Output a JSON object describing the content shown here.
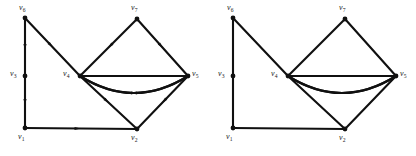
{
  "figure": {
    "title": "",
    "background_color": "#ffffff",
    "stroke_color": "#101010",
    "width": 416,
    "height": 156,
    "panel_count": 2
  },
  "panels": [
    {
      "id": "left-panel",
      "name": "directed-multigraph",
      "directed": true,
      "origin_x": 0,
      "vertices": [
        {
          "id": "v6",
          "label": "v",
          "sub": "6",
          "x": 25,
          "y": 18,
          "label_x": 19,
          "label_y": 4,
          "dot": true
        },
        {
          "id": "v3",
          "label": "v",
          "sub": "3",
          "x": 25,
          "y": 76,
          "label_x": 10,
          "label_y": 70,
          "dot": true
        },
        {
          "id": "v1",
          "label": "v",
          "sub": "1",
          "x": 25,
          "y": 128,
          "label_x": 18,
          "label_y": 133,
          "dot": true
        },
        {
          "id": "v4",
          "label": "v",
          "sub": "4",
          "x": 80,
          "y": 76,
          "label_x": 63,
          "label_y": 70,
          "dot": true
        },
        {
          "id": "v7",
          "label": "v",
          "sub": "7",
          "x": 137,
          "y": 19,
          "label_x": 131,
          "label_y": 4,
          "dot": true
        },
        {
          "id": "v2",
          "label": "v",
          "sub": "2",
          "x": 137,
          "y": 129,
          "label_x": 131,
          "label_y": 134,
          "dot": true
        },
        {
          "id": "v5",
          "label": "v",
          "sub": "5",
          "x": 188,
          "y": 76,
          "label_x": 192,
          "label_y": 70,
          "dot": true
        }
      ],
      "edges": [
        {
          "id": "e-v6-v3",
          "from": "v6",
          "to": "v3",
          "kind": "line",
          "arrow": "forward"
        },
        {
          "id": "e-v3-v1",
          "from": "v3",
          "to": "v1",
          "kind": "line",
          "arrow": "forward"
        },
        {
          "id": "e-v1-v2",
          "from": "v1",
          "to": "v2",
          "kind": "line",
          "arrow": "forward"
        },
        {
          "id": "e-v6-v4",
          "from": "v6",
          "to": "v4",
          "kind": "line",
          "arrow": "forward"
        },
        {
          "id": "e-v7-v4",
          "from": "v7",
          "to": "v4",
          "kind": "line",
          "arrow": "forward"
        },
        {
          "id": "e-v7-v5",
          "from": "v7",
          "to": "v5",
          "kind": "line",
          "arrow": "forward"
        },
        {
          "id": "e-v4-v2",
          "from": "v4",
          "to": "v2",
          "kind": "line",
          "arrow": "forward"
        },
        {
          "id": "e-v5-v2",
          "from": "v5",
          "to": "v2",
          "kind": "line",
          "arrow": "forward"
        },
        {
          "id": "e-v5-v4-upper",
          "from": "v5",
          "to": "v4",
          "kind": "curve",
          "bow": -17,
          "arrow": "forward"
        },
        {
          "id": "e-v4-v5-middle",
          "from": "v4",
          "to": "v5",
          "kind": "curve",
          "bow": 0,
          "arrow": "none"
        },
        {
          "id": "e-v4-v5-lower",
          "from": "v4",
          "to": "v5",
          "kind": "curve",
          "bow": 17,
          "arrow": "forward"
        }
      ]
    },
    {
      "id": "right-panel",
      "name": "undirected-multigraph",
      "directed": false,
      "origin_x": 208,
      "vertices": [
        {
          "id": "v6",
          "label": "v",
          "sub": "6",
          "x": 25,
          "y": 18,
          "label_x": 19,
          "label_y": 4,
          "dot": true
        },
        {
          "id": "v3",
          "label": "v",
          "sub": "3",
          "x": 25,
          "y": 76,
          "label_x": 10,
          "label_y": 70,
          "dot": true
        },
        {
          "id": "v1",
          "label": "v",
          "sub": "1",
          "x": 25,
          "y": 128,
          "label_x": 18,
          "label_y": 133,
          "dot": true
        },
        {
          "id": "v4",
          "label": "v",
          "sub": "4",
          "x": 80,
          "y": 76,
          "label_x": 63,
          "label_y": 70,
          "dot": true
        },
        {
          "id": "v7",
          "label": "v",
          "sub": "7",
          "x": 137,
          "y": 19,
          "label_x": 131,
          "label_y": 4,
          "dot": true
        },
        {
          "id": "v2",
          "label": "v",
          "sub": "2",
          "x": 137,
          "y": 129,
          "label_x": 131,
          "label_y": 134,
          "dot": true
        },
        {
          "id": "v5",
          "label": "v",
          "sub": "5",
          "x": 188,
          "y": 76,
          "label_x": 192,
          "label_y": 70,
          "dot": true
        }
      ],
      "edges": [
        {
          "id": "e-v6-v3",
          "from": "v6",
          "to": "v3",
          "kind": "line",
          "arrow": "none"
        },
        {
          "id": "e-v3-v1",
          "from": "v3",
          "to": "v1",
          "kind": "line",
          "arrow": "none"
        },
        {
          "id": "e-v1-v2",
          "from": "v1",
          "to": "v2",
          "kind": "line",
          "arrow": "none"
        },
        {
          "id": "e-v6-v4",
          "from": "v6",
          "to": "v4",
          "kind": "line",
          "arrow": "none"
        },
        {
          "id": "e-v7-v4",
          "from": "v7",
          "to": "v4",
          "kind": "line",
          "arrow": "none"
        },
        {
          "id": "e-v7-v5",
          "from": "v7",
          "to": "v5",
          "kind": "line",
          "arrow": "none"
        },
        {
          "id": "e-v4-v2",
          "from": "v4",
          "to": "v2",
          "kind": "line",
          "arrow": "none"
        },
        {
          "id": "e-v5-v2",
          "from": "v5",
          "to": "v2",
          "kind": "line",
          "arrow": "none"
        },
        {
          "id": "e-v5-v4-upper",
          "from": "v5",
          "to": "v4",
          "kind": "curve",
          "bow": -17,
          "arrow": "none"
        },
        {
          "id": "e-v4-v5-middle",
          "from": "v4",
          "to": "v5",
          "kind": "curve",
          "bow": 0,
          "arrow": "none"
        },
        {
          "id": "e-v4-v5-lower",
          "from": "v4",
          "to": "v5",
          "kind": "curve",
          "bow": 17,
          "arrow": "none"
        }
      ]
    }
  ]
}
